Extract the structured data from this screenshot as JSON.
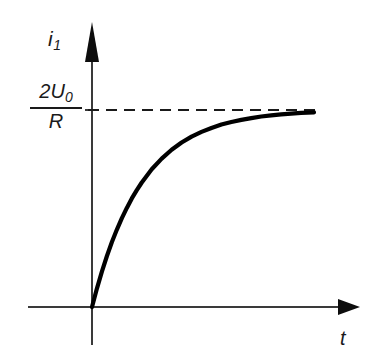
{
  "figure": {
    "title": "",
    "background_color": "#ffffff",
    "line_color": "#1a1a1a",
    "curve_color": "#000000"
  },
  "axes": {
    "y_axis": {
      "label_main": "i",
      "label_sub": "1",
      "arrow": "up-arrow-icon"
    },
    "x_axis": {
      "label": "t",
      "arrow": "right-arrow-icon"
    }
  },
  "annotations": {
    "asymptote": {
      "numerator_lead": "2",
      "numerator_symbol": "U",
      "numerator_sub": "0",
      "denominator": "R",
      "style": "dashed"
    }
  },
  "chart_data": {
    "type": "line",
    "title": "",
    "xlabel": "t",
    "ylabel": "i_1",
    "grid": false,
    "legend": null,
    "xlim": [
      0,
      4.5
    ],
    "ylim": [
      0,
      1.12
    ],
    "asymptote_y": 1.0,
    "asymptote_label": "2U_0/R",
    "function": "i_1(t) = (2*U_0/R) * (1 - exp(-t/tau))",
    "series": [
      {
        "name": "i_1",
        "x": [
          0.0,
          0.1,
          0.2,
          0.3,
          0.4,
          0.5,
          0.6,
          0.7,
          0.8,
          0.9,
          1.0,
          1.2,
          1.4,
          1.6,
          1.8,
          2.0,
          2.2,
          2.4,
          2.6,
          2.8,
          3.0,
          3.2,
          3.4,
          3.6,
          3.8,
          4.0,
          4.2,
          4.46
        ],
        "y": [
          0.0,
          0.095,
          0.181,
          0.259,
          0.33,
          0.393,
          0.451,
          0.503,
          0.551,
          0.593,
          0.632,
          0.699,
          0.753,
          0.798,
          0.835,
          0.865,
          0.889,
          0.909,
          0.926,
          0.939,
          0.95,
          0.959,
          0.967,
          0.973,
          0.978,
          0.982,
          0.985,
          0.988
        ]
      }
    ],
    "xticks": [],
    "yticks": [
      1.0
    ],
    "ytick_labels": [
      "2U_0/R"
    ]
  }
}
